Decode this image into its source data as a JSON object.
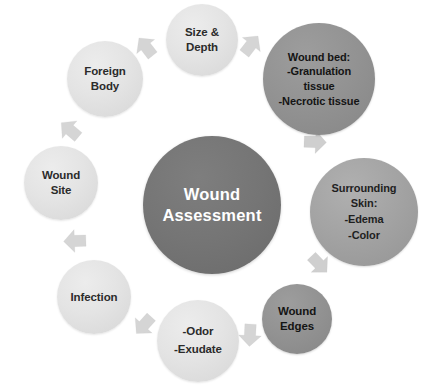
{
  "diagram": {
    "title": "Wound Assessment",
    "type": "cycle",
    "center": {
      "id": "center",
      "tone": "center",
      "lines": [
        "Wound",
        "Assessment"
      ]
    },
    "nodes": [
      {
        "id": "size-depth",
        "tone": "light",
        "lines": [
          "Size &",
          "Depth"
        ]
      },
      {
        "id": "wound-bed",
        "tone": "dark",
        "lines": [
          "Wound bed:",
          "-Granulation",
          "tissue",
          "-Necrotic tissue"
        ]
      },
      {
        "id": "surrounding",
        "tone": "mid",
        "lines": [
          "Surrounding",
          "Skin:",
          "-Edema",
          "-Color"
        ]
      },
      {
        "id": "wound-edges",
        "tone": "dark",
        "lines": [
          "Wound",
          "Edges"
        ]
      },
      {
        "id": "odor",
        "tone": "light",
        "lines": [
          "-Odor",
          "-Exudate"
        ]
      },
      {
        "id": "infection",
        "tone": "light",
        "lines": [
          "Infection"
        ]
      },
      {
        "id": "wound-site",
        "tone": "light",
        "lines": [
          "Wound",
          "Site"
        ]
      },
      {
        "id": "foreign-body",
        "tone": "light",
        "lines": [
          "Foreign",
          "Body"
        ]
      }
    ],
    "arrows": [
      {
        "id": "1",
        "from": "foreign-body",
        "to": "size-depth"
      },
      {
        "id": "2",
        "from": "size-depth",
        "to": "wound-bed"
      },
      {
        "id": "3",
        "from": "wound-bed",
        "to": "surrounding"
      },
      {
        "id": "4",
        "from": "surrounding",
        "to": "wound-edges"
      },
      {
        "id": "5",
        "from": "wound-edges",
        "to": "odor"
      },
      {
        "id": "6",
        "from": "odor",
        "to": "infection"
      },
      {
        "id": "7",
        "from": "infection",
        "to": "wound-site"
      },
      {
        "id": "8",
        "from": "wound-site",
        "to": "foreign-body"
      }
    ],
    "colors": {
      "light": "#e4e4e4",
      "mid": "#a3a3a3",
      "dark": "#929292",
      "center": "#757575",
      "arrow": "#d5d5d5",
      "background": "#ffffff"
    }
  }
}
